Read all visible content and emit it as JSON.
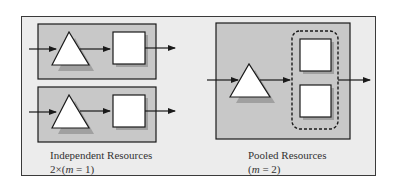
{
  "diagram": {
    "left_panel": {
      "title": "Independent Resources",
      "subtitle": "2×(m = 1)",
      "subtitle_prefix": "2×(",
      "subtitle_var": "m",
      "subtitle_suffix": " = 1)",
      "lanes": 2
    },
    "right_panel": {
      "title": "Pooled Resources",
      "subtitle": "(m = 2)",
      "subtitle_prefix": "(",
      "subtitle_var": "m",
      "subtitle_suffix": " = 2)",
      "servers": 2
    },
    "colors": {
      "frame_bg": "#ececec",
      "panel_bg": "#c8c8c8",
      "shape_fill": "#ffffff",
      "stroke": "#1a1a1a",
      "shadow": "#a0a0a0"
    }
  }
}
